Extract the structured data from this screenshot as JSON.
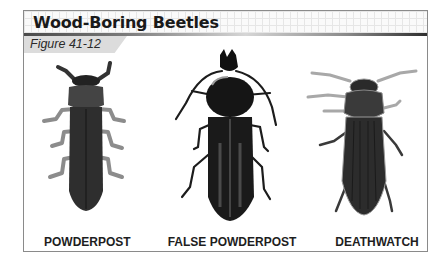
{
  "header": {
    "title": "Wood-Boring Beetles",
    "figure_label": "Figure 41-12"
  },
  "beetles": [
    {
      "name": "POWDERPOST",
      "icon": "powderpost-beetle-illustration"
    },
    {
      "name": "FALSE POWDERPOST",
      "icon": "false-powderpost-beetle-illustration"
    },
    {
      "name": "DEATHWATCH",
      "icon": "deathwatch-beetle-illustration"
    }
  ],
  "colors": {
    "frame_border": "#8a8a8a",
    "figure_tag_bg": "#dcdcdc",
    "beetle_body": "#2b2b2b",
    "beetle_legs": "#9a9a9a"
  }
}
